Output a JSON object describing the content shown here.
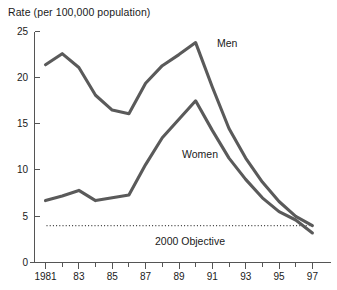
{
  "chart_data": {
    "type": "line",
    "title": "Rate (per 100,000 population)",
    "xlabel": "",
    "ylabel": "Rate (per 100,000 population)",
    "xlim": [
      1981,
      1997
    ],
    "ylim": [
      0,
      25
    ],
    "grid": false,
    "legend_position": "inline-annotation",
    "x": [
      1981,
      1982,
      1983,
      1984,
      1985,
      1986,
      1987,
      1988,
      1989,
      1990,
      1991,
      1992,
      1993,
      1994,
      1995,
      1996,
      1997
    ],
    "y_ticks": [
      0,
      5,
      10,
      15,
      20,
      25
    ],
    "y_tick_labels": [
      "0",
      "5",
      "10",
      "15",
      "20",
      "25"
    ],
    "x_tick_labels": [
      "1981",
      "83",
      "85",
      "87",
      "89",
      "91",
      "93",
      "95",
      "97"
    ],
    "x_major_ticks": [
      1981,
      1983,
      1985,
      1987,
      1989,
      1991,
      1993,
      1995,
      1997
    ],
    "series": [
      {
        "name": "Men",
        "label": "Men",
        "color": "#5a5a5a",
        "values": [
          21.4,
          22.6,
          21.1,
          18.1,
          16.5,
          16.1,
          19.4,
          21.3,
          22.5,
          23.8,
          19.0,
          14.5,
          11.3,
          8.7,
          6.6,
          5.0,
          4.0
        ]
      },
      {
        "name": "Women",
        "label": "Women",
        "color": "#5a5a5a",
        "values": [
          6.7,
          7.2,
          7.8,
          6.7,
          7.0,
          7.3,
          10.6,
          13.5,
          15.5,
          17.5,
          14.3,
          11.3,
          9.0,
          7.0,
          5.5,
          4.6,
          3.2
        ]
      }
    ],
    "reference_line": {
      "label": "2000 Objective",
      "value": 4.0,
      "style": "dotted",
      "color": "#3a3a3a"
    },
    "annotations": [
      {
        "text": "Men",
        "x": 1991.3,
        "y": 23.3
      },
      {
        "text": "Women",
        "x": 1988.0,
        "y": 11.6
      },
      {
        "text": "2000 Objective",
        "x": 1990.0,
        "y": 2.3
      }
    ]
  },
  "axis": {
    "y_labels": [
      "25",
      "20",
      "15",
      "10",
      "5",
      "0"
    ],
    "x_labels": [
      "1981",
      "83",
      "85",
      "87",
      "89",
      "91",
      "93",
      "95",
      "97"
    ]
  },
  "labels": {
    "men": "Men",
    "women": "Women",
    "objective": "2000 Objective",
    "title": "Rate (per 100,000 population)"
  }
}
